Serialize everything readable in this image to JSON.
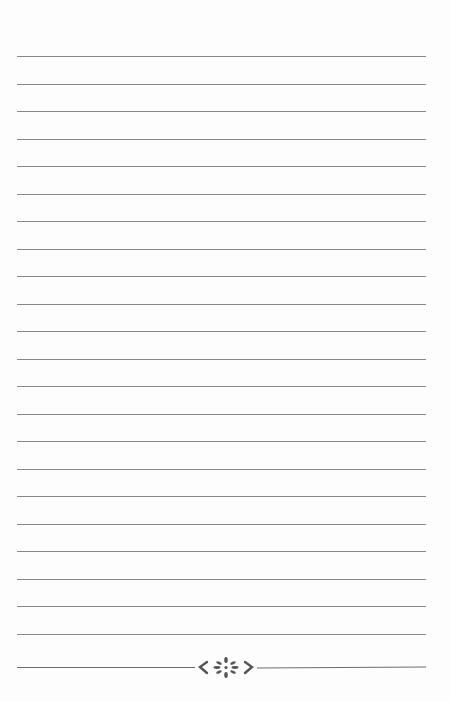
{
  "page": {
    "type": "lined-notebook-page",
    "background_color": "#fdfdfd",
    "line_color": "#7a7a7a",
    "line_count": 22,
    "first_line_y": 56,
    "line_spacing": 27.5,
    "line_left": 17,
    "line_right": 426
  },
  "ornament": {
    "icon": "flower-scroll-ornament-icon",
    "color": "#555555",
    "y": 668
  }
}
